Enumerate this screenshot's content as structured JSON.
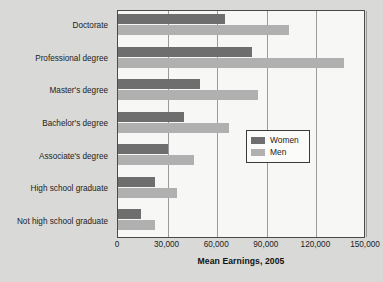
{
  "chart_data": {
    "type": "bar",
    "orientation": "horizontal",
    "title": "",
    "xlabel": "Mean Earnings, 2005",
    "ylabel": "",
    "xlim": [
      0,
      150000
    ],
    "xticks": [
      0,
      30000,
      60000,
      90000,
      120000,
      150000
    ],
    "xtick_labels": [
      "0",
      "30,000",
      "60,000",
      "90,000",
      "120,000",
      "150,000"
    ],
    "grid": "vertical",
    "legend_position": "center-right",
    "categories": [
      "Doctorate",
      "Professional degree",
      "Master's degree",
      "Bachelor's degree",
      "Associate's degree",
      "High school graduate",
      "Not high school graduate"
    ],
    "series": [
      {
        "name": "Women",
        "color": "#6e6e6e",
        "values": [
          64700,
          81000,
          49400,
          39700,
          30200,
          22200,
          14100
        ]
      },
      {
        "name": "Men",
        "color": "#b0b0b0",
        "values": [
          103300,
          136400,
          84700,
          67100,
          46000,
          35900,
          22400
        ]
      }
    ]
  },
  "legend": {
    "items": [
      {
        "label": "Women",
        "color": "#6e6e6e"
      },
      {
        "label": "Men",
        "color": "#b0b0b0"
      }
    ]
  },
  "colors": {
    "page_background": "#d9d9d7",
    "plot_background": "#f7f7f5",
    "axis": "#4a4a4a",
    "gridline": "#9a9a9a",
    "women_bar": "#6e6e6e",
    "men_bar": "#b0b0b0"
  }
}
